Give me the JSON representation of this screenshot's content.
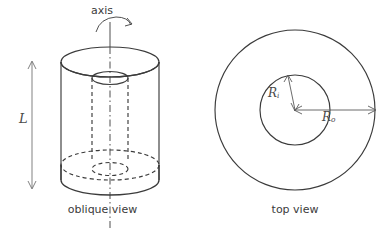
{
  "figure": {
    "type": "technical-diagram",
    "background_color": "#ffffff",
    "line_color": "#3b3b3b",
    "label_color": "#4a4a4a"
  },
  "panels": {
    "oblique": {
      "caption": "oblique view",
      "axis_label": "axis",
      "length_label": "L"
    },
    "top": {
      "caption": "top view",
      "inner_radius_label": "R",
      "inner_radius_subscript": "i",
      "outer_radius_label": "R",
      "outer_radius_subscript": "o"
    }
  },
  "geometry": {
    "oblique": {
      "center_x": 110,
      "outer_rx": 49,
      "outer_ry": 15,
      "inner_rx": 18,
      "inner_ry": 6,
      "top_y": 62,
      "bottom_y": 180,
      "axis_top_y": 22,
      "axis_bottom_y": 228
    },
    "top_view": {
      "center_x": 295,
      "center_y": 110,
      "outer_r": 80,
      "inner_r": 35
    }
  }
}
